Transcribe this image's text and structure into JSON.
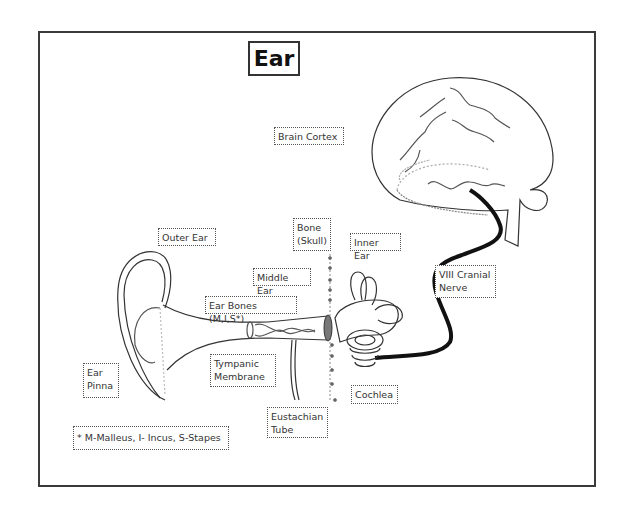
{
  "diagram": {
    "title": "Ear",
    "labels": {
      "brain_cortex": "Brain Cortex",
      "outer_ear": "Outer Ear",
      "bone_skull": "Bone\n(Skull)",
      "inner_ear": "Inner Ear",
      "middle_ear": "Middle Ear",
      "ear_bones": "Ear Bones (M,I,S*)",
      "viii_cranial_nerve": "VIII Cranial\nNerve",
      "tympanic_membrane": "Tympanic\nMembrane",
      "ear_pinna": "Ear\nPinna",
      "cochlea": "Cochlea",
      "eustachian_tube": "Eustachian\nTube",
      "footnote": "* M-Malleus, I- Incus, S-Stapes"
    },
    "colors": {
      "line": "#333333",
      "nerve": "#111111",
      "label_border": "#555555",
      "eardrum_fill": "#777777"
    }
  }
}
